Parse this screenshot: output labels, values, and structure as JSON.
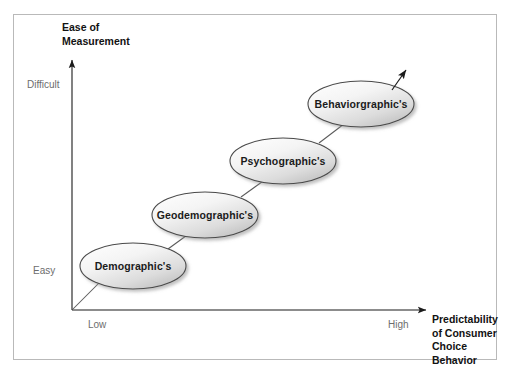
{
  "figure": {
    "type": "diagram",
    "subtype": "stepped-ellipse-progression",
    "border_color": "#b9b9b9",
    "background": "#ffffff"
  },
  "axes": {
    "y": {
      "title": "Ease of\nMeasurement",
      "high_label": "Difficult",
      "low_label": "Easy",
      "color": "#1b1b1b"
    },
    "x": {
      "title": "Predictability\nof Consumer\nChoice Behavior",
      "low_label": "Low",
      "high_label": "High",
      "color": "#1b1b1b"
    },
    "tick_color": "#6d6d6d"
  },
  "nodes": [
    {
      "id": "demographics",
      "label": "Demographic's",
      "cx": 133,
      "cy": 266,
      "rx": 53,
      "ry": 23
    },
    {
      "id": "geodemographics",
      "label": "Geodemographic's",
      "cx": 205,
      "cy": 215,
      "rx": 53,
      "ry": 23
    },
    {
      "id": "psychographics",
      "label": "Psychographic's",
      "cx": 283,
      "cy": 161,
      "rx": 53,
      "ry": 23
    },
    {
      "id": "behaviorgraphics",
      "label": "Behaviorgraphic's",
      "cx": 361,
      "cy": 104,
      "rx": 53,
      "ry": 23
    }
  ],
  "connectors": [
    {
      "from": "origin",
      "to": "demographics"
    },
    {
      "from": "demographics",
      "to": "geodemographics"
    },
    {
      "from": "geodemographics",
      "to": "psychographics"
    },
    {
      "from": "psychographics",
      "to": "behaviorgraphics"
    },
    {
      "from": "behaviorgraphics",
      "to": "growth-arrow"
    }
  ],
  "style": {
    "ellipse_stroke": "#4a4a4a",
    "ellipse_fill_light": "#fdfdfd",
    "ellipse_fill_dark": "#c9c9c9",
    "connector_color": "#5a5a5a",
    "shadow_color": "#b0b0b0"
  }
}
